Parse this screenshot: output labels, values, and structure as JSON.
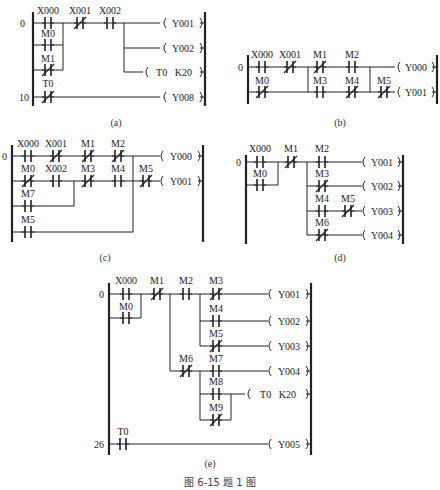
{
  "figure_caption": "图 6-15   题 1 图",
  "diagrams": {
    "a": {
      "caption": "(a)",
      "step_labels": [
        "0",
        "10"
      ],
      "contacts": [
        {
          "name": "X000",
          "type": "NO"
        },
        {
          "name": "X001",
          "type": "NC"
        },
        {
          "name": "X002",
          "type": "NO"
        },
        {
          "name": "M0",
          "type": "NO"
        },
        {
          "name": "M1",
          "type": "NC"
        },
        {
          "name": "T0",
          "type": "NC"
        }
      ],
      "coils": [
        "Y001",
        "Y002",
        "T0   K20",
        "Y008"
      ]
    },
    "b": {
      "caption": "(b)",
      "step_labels": [
        "0"
      ],
      "contacts": [
        {
          "name": "X000",
          "type": "NO"
        },
        {
          "name": "X001",
          "type": "NC"
        },
        {
          "name": "M1",
          "type": "NC"
        },
        {
          "name": "M2",
          "type": "NO"
        },
        {
          "name": "M0",
          "type": "NC"
        },
        {
          "name": "M3",
          "type": "NO"
        },
        {
          "name": "M4",
          "type": "NC"
        },
        {
          "name": "M5",
          "type": "NC"
        }
      ],
      "coils": [
        "Y000",
        "Y001"
      ]
    },
    "c": {
      "caption": "(c)",
      "step_labels": [
        "0"
      ],
      "contacts": [
        {
          "name": "X000",
          "type": "NO"
        },
        {
          "name": "X001",
          "type": "NC"
        },
        {
          "name": "M1",
          "type": "NC"
        },
        {
          "name": "M2",
          "type": "NC"
        },
        {
          "name": "M0",
          "type": "NC"
        },
        {
          "name": "X002",
          "type": "NO"
        },
        {
          "name": "M3",
          "type": "NC"
        },
        {
          "name": "M4",
          "type": "NO"
        },
        {
          "name": "M5",
          "type": "NC"
        },
        {
          "name": "M7",
          "type": "NO"
        },
        {
          "name": "M5",
          "type": "NO"
        }
      ],
      "coils": [
        "Y000",
        "Y001"
      ]
    },
    "d": {
      "caption": "(d)",
      "step_labels": [
        "0"
      ],
      "contacts": [
        {
          "name": "X000",
          "type": "NO"
        },
        {
          "name": "M1",
          "type": "NC"
        },
        {
          "name": "M2",
          "type": "NO"
        },
        {
          "name": "M0",
          "type": "NO"
        },
        {
          "name": "M3",
          "type": "NC"
        },
        {
          "name": "M4",
          "type": "NO"
        },
        {
          "name": "M5",
          "type": "NC"
        },
        {
          "name": "M6",
          "type": "NC"
        }
      ],
      "coils": [
        "Y001",
        "Y002",
        "Y003",
        "Y004"
      ]
    },
    "e": {
      "caption": "(e)",
      "step_labels": [
        "0",
        "26"
      ],
      "contacts": [
        {
          "name": "X000",
          "type": "NO"
        },
        {
          "name": "M1",
          "type": "NC"
        },
        {
          "name": "M2",
          "type": "NO"
        },
        {
          "name": "M3",
          "type": "NC"
        },
        {
          "name": "M0",
          "type": "NO"
        },
        {
          "name": "M4",
          "type": "NO"
        },
        {
          "name": "M5",
          "type": "NC"
        },
        {
          "name": "M6",
          "type": "NC"
        },
        {
          "name": "M7",
          "type": "NO"
        },
        {
          "name": "M8",
          "type": "NO"
        },
        {
          "name": "M9",
          "type": "NC"
        },
        {
          "name": "T0",
          "type": "NO"
        }
      ],
      "coils": [
        "Y001",
        "Y002",
        "Y003",
        "Y004",
        "T0   K20",
        "Y005"
      ]
    }
  }
}
